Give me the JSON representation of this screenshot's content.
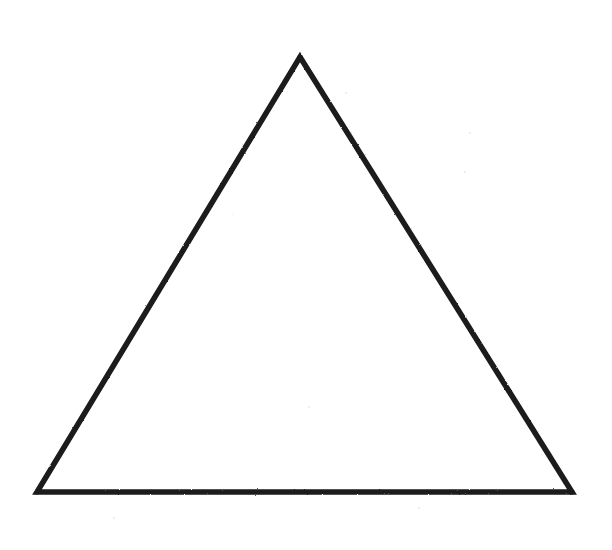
{
  "figure": {
    "type": "line-drawing",
    "canvas": {
      "width": 612,
      "height": 550,
      "background_color": "#ffffff"
    },
    "shape": {
      "name": "equilateral-triangle",
      "orientation": "apex-up",
      "closed": true,
      "fill_color": "none",
      "stroke_color": "#1a1a1a",
      "stroke_width": 5.5,
      "stroke_style": "hand-drawn-ink",
      "vertices": [
        {
          "label": "apex",
          "x": 300,
          "y": 57
        },
        {
          "label": "bottom-right",
          "x": 572,
          "y": 492
        },
        {
          "label": "bottom-left",
          "x": 37,
          "y": 492
        }
      ],
      "points_attr": "300,57 572,492 37,492",
      "edges": [
        {
          "label": "left-edge",
          "from": "apex",
          "to": "bottom-left"
        },
        {
          "label": "right-edge",
          "from": "apex",
          "to": "bottom-right"
        },
        {
          "label": "base-edge",
          "from": "bottom-left",
          "to": "bottom-right"
        }
      ],
      "measurements": {
        "base_length_px": 535,
        "height_px": 435,
        "apex_x_px": 300,
        "base_y_px": 492
      }
    },
    "artifacts": [
      {
        "name": "scan-speck",
        "x": 345,
        "y": 92,
        "size": 2
      },
      {
        "name": "scan-speck",
        "x": 469,
        "y": 132,
        "size": 2
      },
      {
        "name": "scan-speck",
        "x": 464,
        "y": 171,
        "size": 2
      },
      {
        "name": "scan-speck",
        "x": 308,
        "y": 406,
        "size": 2
      },
      {
        "name": "scan-speck",
        "x": 113,
        "y": 517,
        "size": 2
      },
      {
        "name": "scan-speck",
        "x": 418,
        "y": 507,
        "size": 2
      },
      {
        "name": "scan-speck",
        "x": 232,
        "y": 214,
        "size": 1
      }
    ]
  }
}
